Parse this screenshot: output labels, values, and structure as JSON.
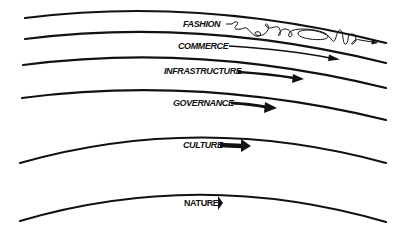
{
  "diagram": {
    "layers": [
      {
        "label": "FASHION",
        "order": 1,
        "speed": "fastest",
        "arrow_style": "wiggly"
      },
      {
        "label": "COMMERCE",
        "order": 2,
        "arrow_style": "thin-long"
      },
      {
        "label": "INFRASTRUCTURE",
        "order": 3,
        "arrow_style": "medium"
      },
      {
        "label": "GOVERNANCE",
        "order": 4,
        "arrow_style": "medium-thick"
      },
      {
        "label": "CULTURE",
        "order": 5,
        "arrow_style": "thick-short"
      },
      {
        "label": "NATURE",
        "order": 6,
        "speed": "slowest",
        "arrow_style": "stub"
      }
    ],
    "colors": {
      "stroke": "#111111",
      "background": "#ffffff"
    }
  }
}
